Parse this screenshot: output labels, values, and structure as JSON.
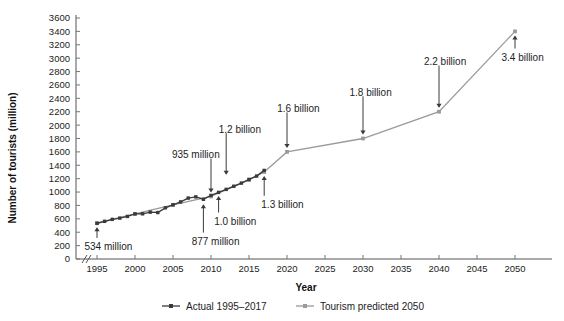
{
  "chart_data": {
    "type": "line",
    "title": "",
    "xlabel": "Year",
    "ylabel": "Number of tourists (million)",
    "xlim": [
      1993,
      2050
    ],
    "ylim": [
      0,
      3600
    ],
    "grid": false,
    "axis_break_x": true,
    "legend_position": "bottom",
    "xticks": [
      1995,
      2000,
      2005,
      2010,
      2015,
      2020,
      2025,
      2030,
      2035,
      2040,
      2045,
      2050
    ],
    "xtick_labels": [
      "1995",
      "2000",
      "2005",
      "2010",
      "2015",
      "2020",
      "2025",
      "2030",
      "2035",
      "2040",
      "2045",
      "2050"
    ],
    "yticks": [
      0,
      200,
      400,
      600,
      800,
      1000,
      1200,
      1400,
      1600,
      1800,
      2000,
      2200,
      2400,
      2600,
      2800,
      3000,
      3200,
      3400,
      3600
    ],
    "ytick_labels": [
      "0",
      "200",
      "400",
      "600",
      "800",
      "1000",
      "1200",
      "1400",
      "1600",
      "1800",
      "2000",
      "2200",
      "2400",
      "2600",
      "2800",
      "3000",
      "3200",
      "3400",
      "3600"
    ],
    "series": [
      {
        "name": "Actual 1995–2017",
        "color": "#3a3a3a",
        "x": [
          1995,
          1996,
          1997,
          1998,
          1999,
          2000,
          2001,
          2002,
          2003,
          2004,
          2005,
          2006,
          2007,
          2008,
          2009,
          2010,
          2011,
          2012,
          2013,
          2014,
          2015,
          2016,
          2017
        ],
        "values": [
          534,
          563,
          592,
          611,
          636,
          674,
          675,
          700,
          694,
          765,
          809,
          853,
          910,
          928,
          892,
          950,
          995,
          1040,
          1087,
          1134,
          1189,
          1239,
          1323
        ]
      },
      {
        "name": "Tourism predicted 2050",
        "color": "#9a9a9a",
        "x": [
          1995,
          2000,
          2005,
          2010,
          2015,
          2017,
          2020,
          2030,
          2040,
          2050
        ],
        "values": [
          534,
          674,
          809,
          935,
          1180,
          1300,
          1600,
          1800,
          2200,
          3400
        ]
      }
    ],
    "annotations": [
      {
        "label": "534 million",
        "x": 1995,
        "y": 534,
        "text_x": 1996.5,
        "text_y": 180,
        "anchor": "middle"
      },
      {
        "label": "877 million",
        "x": 2009,
        "y": 877,
        "text_x": 2010.6,
        "text_y": 260,
        "anchor": "middle"
      },
      {
        "label": "935 million",
        "x": 2010,
        "y": 935,
        "text_x": 2008.0,
        "text_y": 1560,
        "anchor": "middle"
      },
      {
        "label": "1.0 billion",
        "x": 2011,
        "y": 1000,
        "text_x": 2013.2,
        "text_y": 560,
        "anchor": "middle"
      },
      {
        "label": "1.2 billion",
        "x": 2012,
        "y": 1200,
        "text_x": 2013.8,
        "text_y": 1940,
        "anchor": "middle"
      },
      {
        "label": "1.3 billion",
        "x": 2017,
        "y": 1300,
        "text_x": 2019.4,
        "text_y": 810,
        "anchor": "middle"
      },
      {
        "label": "1.6 billion",
        "x": 2020,
        "y": 1600,
        "text_x": 2021.5,
        "text_y": 2250,
        "anchor": "middle"
      },
      {
        "label": "1.8 billion",
        "x": 2030,
        "y": 1800,
        "text_x": 2031.0,
        "text_y": 2490,
        "anchor": "middle"
      },
      {
        "label": "2.2 billion",
        "x": 2040,
        "y": 2200,
        "text_x": 2040.8,
        "text_y": 2950,
        "anchor": "middle"
      },
      {
        "label": "3.4 billion",
        "x": 2050,
        "y": 3400,
        "text_x": 2051.0,
        "text_y": 3010,
        "anchor": "middle"
      }
    ],
    "legend": [
      {
        "label": "Actual 1995–2017",
        "color": "#3a3a3a"
      },
      {
        "label": "Tourism predicted 2050",
        "color": "#9a9a9a"
      }
    ]
  },
  "axis": {
    "x_title": "Year",
    "y_title": "Number of tourists (million)"
  },
  "ytick_text": {
    "t0": "0",
    "t1": "200",
    "t2": "400",
    "t3": "600",
    "t4": "800",
    "t5": "1000",
    "t6": "1200",
    "t7": "1400",
    "t8": "1600",
    "t9": "1800",
    "t10": "2000",
    "t11": "2200",
    "t12": "2400",
    "t13": "2600",
    "t14": "2800",
    "t15": "3000",
    "t16": "3200",
    "t17": "3400",
    "t18": "3600"
  },
  "xtick_text": {
    "t0": "1995",
    "t1": "2000",
    "t2": "2005",
    "t3": "2010",
    "t4": "2015",
    "t5": "2020",
    "t6": "2025",
    "t7": "2030",
    "t8": "2035",
    "t9": "2040",
    "t10": "2045",
    "t11": "2050"
  },
  "annot_text": {
    "a0": "534 million",
    "a1": "877 million",
    "a2": "935 million",
    "a3": "1.0 billion",
    "a4": "1.2 billion",
    "a5": "1.3 billion",
    "a6": "1.6 billion",
    "a7": "1.8 billion",
    "a8": "2.2 billion",
    "a9": "3.4 billion"
  },
  "legend_text": {
    "l0": "Actual 1995–2017",
    "l1": "Tourism predicted 2050"
  }
}
